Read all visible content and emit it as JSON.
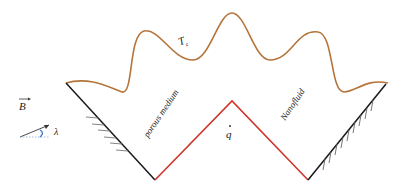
{
  "diagram": {
    "labels": {
      "top_temperature": "T",
      "top_temperature_sub": "c",
      "magnetic_field": "B",
      "angle": "λ",
      "left_region": "porous medium",
      "right_region": "Nanofluid",
      "heat_flux": "q"
    },
    "colors": {
      "wavy_wall": "#b5743a",
      "heated_walls": "#d0352b",
      "insulated_walls": "#1a1a1a",
      "angle_arc": "#3a6fc4"
    }
  }
}
